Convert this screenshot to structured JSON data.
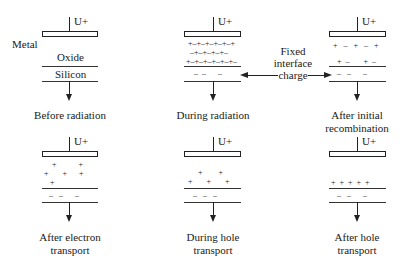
{
  "labels": {
    "voltage": "U+",
    "metal": "Metal",
    "oxide": "Oxide",
    "silicon": "Silicon"
  },
  "annotation": {
    "line1": "Fixed",
    "line2": "interface",
    "line3": "charge"
  },
  "panels": [
    {
      "id": "before-radiation",
      "caption_line1": "Before radiation",
      "caption_line2": "",
      "oxide_rows": [],
      "interface_row": ""
    },
    {
      "id": "during-radiation",
      "caption_line1": "During radiation",
      "caption_line2": "",
      "oxide_rows": [
        "+–+–+–+–+–+",
        "–+–+–+–+–",
        "+–+–+–+–+–+–"
      ],
      "interface_row": "–  –      –"
    },
    {
      "id": "after-initial-recombination",
      "caption_line1": "After initial",
      "caption_line2": "recombination",
      "oxide_rows": [
        "+   –   +   –   +",
        "",
        "  +  –       +  –"
      ],
      "interface_row": "–   –      –"
    },
    {
      "id": "after-electron-transport",
      "caption_line1": "After electron",
      "caption_line2": "transport",
      "oxide_rows": [
        "    +           +",
        "+       +      +",
        "   +"
      ],
      "interface_row": "–   –      –"
    },
    {
      "id": "during-hole-transport",
      "caption_line1": "During hole",
      "caption_line2": "transport",
      "oxide_rows": [
        "",
        "      +        +",
        " +       +       +"
      ],
      "interface_row": "–   –   –"
    },
    {
      "id": "after-hole-transport",
      "caption_line1": "After hole",
      "caption_line2": "transport",
      "oxide_rows": [
        "",
        "",
        "+  +  +  +  +"
      ],
      "interface_row": "–   –      –"
    }
  ]
}
